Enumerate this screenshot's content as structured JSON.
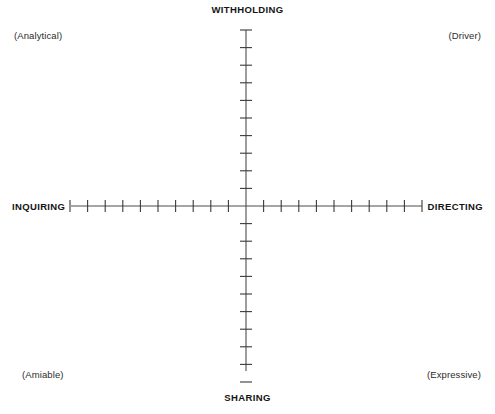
{
  "diagram": {
    "background_color": "#ffffff",
    "axis_color": "#4d4d4d",
    "tick_color": "#3a3a3a",
    "text_color": "#141414",
    "axis_labels": {
      "top": "WITHHOLDING",
      "bottom": "SHARING",
      "left": "INQUIRING",
      "right": "DIRECTING"
    },
    "quadrant_labels": {
      "top_left": "(Analytical)",
      "top_right": "(Driver)",
      "bottom_left": "(Amiable)",
      "bottom_right": "(Expressive)"
    }
  },
  "chart_data": {
    "type": "scatter",
    "title": "",
    "xlabel": "",
    "ylabel": "",
    "grid": false,
    "legend": "none",
    "origin": {
      "x": 246,
      "y": 206
    },
    "x_axis": {
      "left_label": "INQUIRING",
      "right_label": "DIRECTING",
      "start_px": 71,
      "end_px": 422,
      "ticks_per_side": 10,
      "tick_spacing_px": 17.6,
      "tick_half_length_px": 6
    },
    "y_axis": {
      "top_label": "WITHHOLDING",
      "bottom_label": "SHARING",
      "start_px": 30,
      "end_px": 371,
      "ticks_per_side": 10,
      "tick_spacing_px": 17.6,
      "tick_half_length_px": 6
    },
    "quadrants": [
      {
        "position": "top_left",
        "label": "(Analytical)"
      },
      {
        "position": "top_right",
        "label": "(Driver)"
      },
      {
        "position": "bottom_left",
        "label": "(Amiable)"
      },
      {
        "position": "bottom_right",
        "label": "(Expressive)"
      }
    ],
    "series": [
      {
        "name": "plotted_points",
        "x": [],
        "y": []
      }
    ]
  }
}
